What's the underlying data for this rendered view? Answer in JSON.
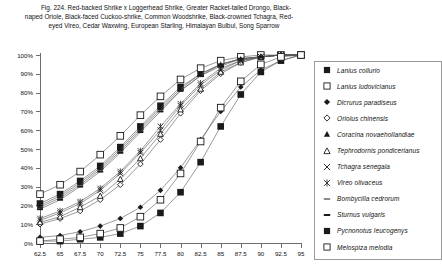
{
  "caption": {
    "line1": "Fig. 224.  Red-backed Shrike x Loggerhead Shrike, Greater Racket-tailed Drongo, Black-",
    "line2": "naped Oriole, Black-faced Cuckoo-shrike, Common Woodshrike, Black-crowned Tchagra, Red-",
    "line3": "eyed Vireo, Cedar Waxwing, European Starling, Himalayan Bulbul, Song Sparrow"
  },
  "legend": {
    "items": [
      {
        "label": "Lanius collurio",
        "marker": "filled-square"
      },
      {
        "label": "Lanius ludovicianus",
        "marker": "open-square"
      },
      {
        "label": "Dicrurus paradiseus",
        "marker": "filled-diamond"
      },
      {
        "label": "Oriolus chinensis",
        "marker": "open-diamond"
      },
      {
        "label": "Coracina novaehollandiae",
        "marker": "filled-triangle"
      },
      {
        "label": "Tephrodornis pondicerianus",
        "marker": "open-triangle"
      },
      {
        "label": "Tchagra senegala",
        "marker": "cross-x"
      },
      {
        "label": "Vireo olivaceus",
        "marker": "asterisk"
      },
      {
        "label": "Bombycilla cedrorum",
        "marker": "thin-dash"
      },
      {
        "label": "Sturnus vulgaris",
        "marker": "thick-dash"
      },
      {
        "label": "Pycnonotus leucogenys",
        "marker": "filled-square"
      },
      {
        "label": "Melospiza melodia",
        "marker": "open-square"
      }
    ]
  },
  "chart_data": {
    "type": "line",
    "title": "",
    "xlabel": "",
    "ylabel": "",
    "grid": false,
    "legend_position": "right",
    "xlim": [
      62.5,
      95
    ],
    "ylim": [
      0,
      100
    ],
    "ytick_labels": [
      "0%",
      "10%",
      "20%",
      "30%",
      "40%",
      "50%",
      "60%",
      "70%",
      "80%",
      "90%",
      "100%"
    ],
    "ytick_values": [
      0,
      10,
      20,
      30,
      40,
      50,
      60,
      70,
      80,
      90,
      100
    ],
    "x": [
      62.5,
      65,
      67.5,
      70,
      72.5,
      75,
      77.5,
      80,
      82.5,
      85,
      87.5,
      90,
      92.5,
      95
    ],
    "xtick_labels": [
      "62.5",
      "65",
      "67.5",
      "70",
      "72.5",
      "75",
      "77.5",
      "80",
      "82.5",
      "85",
      "87.5",
      "90",
      "92.5",
      "95"
    ],
    "series": [
      {
        "name": "Lanius collurio",
        "marker": "filled-square",
        "values": [
          21,
          26,
          33,
          41,
          51,
          62,
          73,
          83,
          90,
          95,
          98,
          99,
          100,
          100
        ]
      },
      {
        "name": "Lanius ludovicianus",
        "marker": "open-square",
        "values": [
          26,
          31,
          38,
          47,
          57,
          68,
          78,
          87,
          93,
          97,
          99,
          100,
          100,
          100
        ]
      },
      {
        "name": "Dicrurus paradiseus",
        "marker": "filled-diamond",
        "values": [
          3,
          4,
          6,
          9,
          13,
          19,
          28,
          40,
          55,
          70,
          83,
          92,
          97,
          100
        ]
      },
      {
        "name": "Oriolus chinensis",
        "marker": "open-diamond",
        "values": [
          10,
          13,
          17,
          23,
          31,
          42,
          55,
          69,
          81,
          90,
          96,
          99,
          100,
          100
        ]
      },
      {
        "name": "Coracina novaehollandiae",
        "marker": "filled-triangle",
        "values": [
          20,
          25,
          32,
          40,
          50,
          61,
          72,
          82,
          90,
          95,
          98,
          99,
          100,
          100
        ]
      },
      {
        "name": "Tephrodornis pondicerianus",
        "marker": "open-triangle",
        "values": [
          11,
          14,
          19,
          25,
          34,
          45,
          58,
          71,
          82,
          91,
          96,
          99,
          100,
          100
        ]
      },
      {
        "name": "Tchagra senegala",
        "marker": "cross-x",
        "values": [
          12,
          16,
          21,
          28,
          37,
          48,
          60,
          73,
          84,
          92,
          97,
          99,
          100,
          100
        ]
      },
      {
        "name": "Vireo olivaceus",
        "marker": "asterisk",
        "values": [
          13,
          17,
          22,
          29,
          38,
          49,
          62,
          74,
          85,
          93,
          97,
          99,
          100,
          100
        ]
      },
      {
        "name": "Bombycilla cedrorum",
        "marker": "thin-dash",
        "values": [
          19,
          24,
          31,
          39,
          49,
          60,
          71,
          81,
          89,
          95,
          98,
          99,
          100,
          100
        ]
      },
      {
        "name": "Sturnus vulgaris",
        "marker": "thick-dash",
        "values": [
          18,
          23,
          30,
          38,
          48,
          59,
          70,
          81,
          89,
          94,
          98,
          99,
          100,
          100
        ]
      },
      {
        "name": "Pycnonotus leucogenys",
        "marker": "filled-square",
        "values": [
          1,
          1,
          2,
          3,
          5,
          9,
          16,
          27,
          43,
          62,
          79,
          91,
          97,
          100
        ]
      },
      {
        "name": "Melospiza melodia",
        "marker": "open-square",
        "values": [
          1,
          2,
          3,
          5,
          8,
          14,
          23,
          37,
          54,
          72,
          86,
          95,
          99,
          100
        ]
      }
    ]
  }
}
